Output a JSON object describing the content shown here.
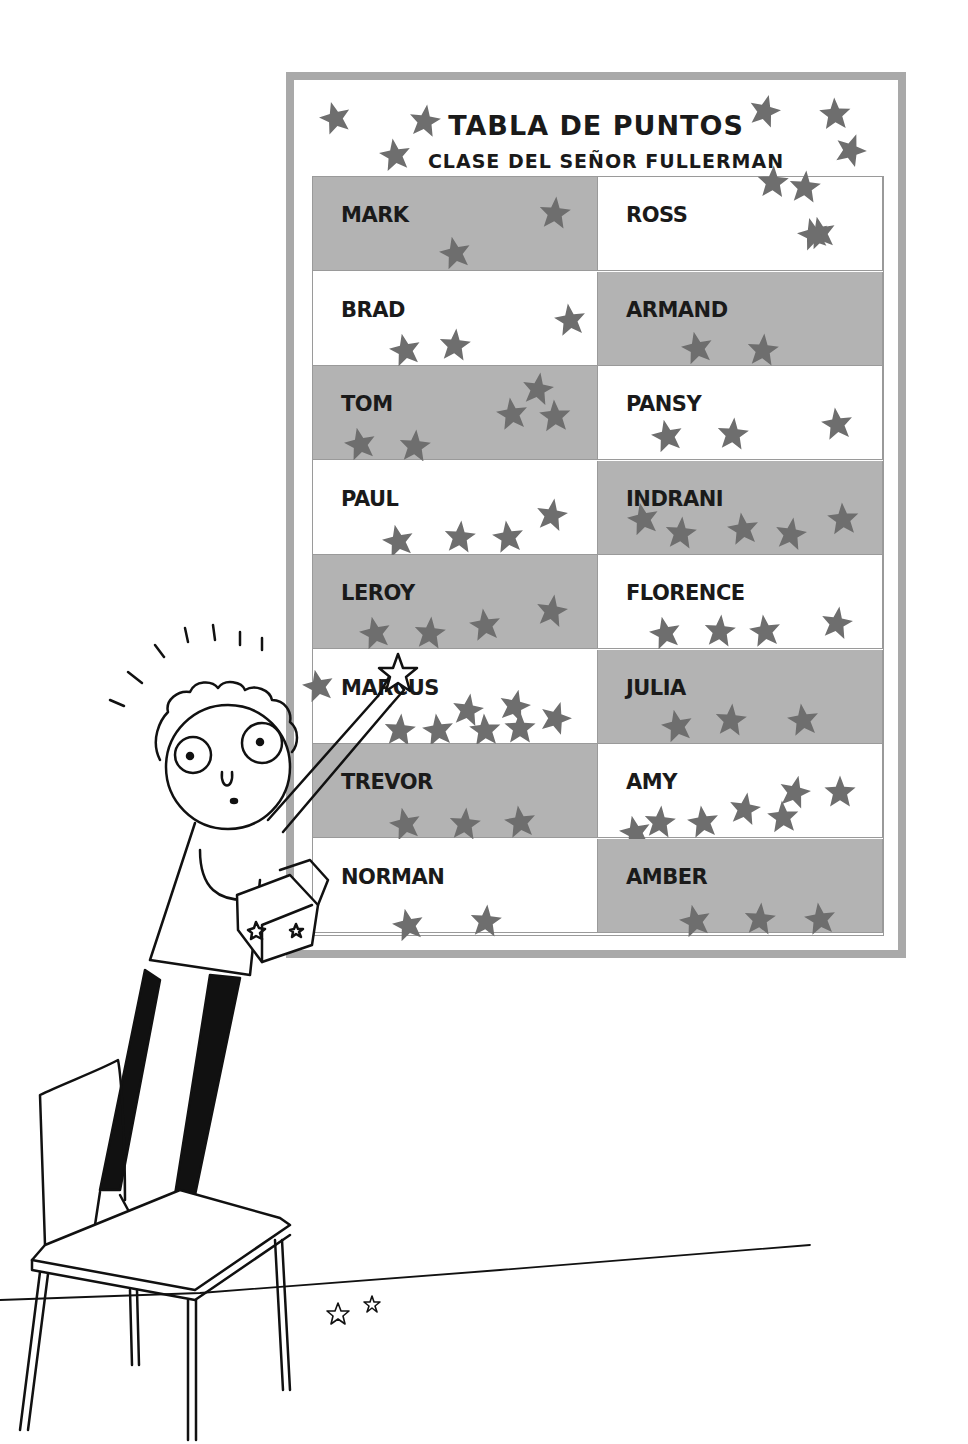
{
  "board": {
    "title": "TABLA DE PUNTOS",
    "subtitle": "CLASE DEL SEÑOR FULLERMAN",
    "colors": {
      "frame": "#a9a9a9",
      "grey_cell": "#b3b3b3",
      "star": "#6e6e6e"
    }
  },
  "students": [
    {
      "name": "MARK",
      "stars": 2
    },
    {
      "name": "ROSS",
      "stars": 2
    },
    {
      "name": "BRAD",
      "stars": 3
    },
    {
      "name": "ARMAND",
      "stars": 2
    },
    {
      "name": "TOM",
      "stars": 5
    },
    {
      "name": "PANSY",
      "stars": 3
    },
    {
      "name": "PAUL",
      "stars": 4
    },
    {
      "name": "INDRANI",
      "stars": 5
    },
    {
      "name": "LEROY",
      "stars": 4
    },
    {
      "name": "FLORENCE",
      "stars": 4
    },
    {
      "name": "MARCUS",
      "stars": 8
    },
    {
      "name": "JULIA",
      "stars": 3
    },
    {
      "name": "TREVOR",
      "stars": 3
    },
    {
      "name": "AMY",
      "stars": 7
    },
    {
      "name": "NORMAN",
      "stars": 2
    },
    {
      "name": "AMBER",
      "stars": 3
    }
  ],
  "scene": {
    "character": "boy standing on chair adding star to chart",
    "floor_stars": 2
  }
}
